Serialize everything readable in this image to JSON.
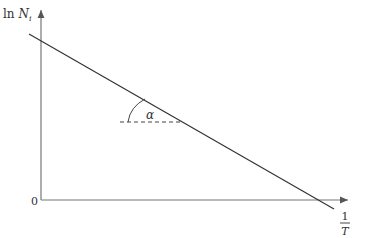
{
  "diagram": {
    "y_axis_label": {
      "prefix": "ln ",
      "var": "N",
      "sub": "i"
    },
    "x_axis_label": {
      "numerator": "1",
      "denominator": "T"
    },
    "origin_label": "0",
    "angle_label": "α",
    "colors": {
      "axis": "#555555",
      "line": "#333333",
      "text": "#333333"
    }
  }
}
